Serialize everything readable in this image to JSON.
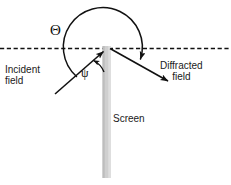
{
  "figure": {
    "background_color": "#ffffff",
    "line_color": "#111111",
    "screen_color": "#c9c9c9",
    "text_color": "#1a1a1a"
  },
  "labels": {
    "incident_line1": "Incident",
    "incident_line2": "field",
    "diffracted_line1": "Diffracted",
    "diffracted_line2": "field",
    "screen": "Screen"
  },
  "symbols": {
    "theta": "Θ",
    "psi": "ψ"
  },
  "elements": {
    "reference_line_name": "dashed-reference-axis",
    "screen_name": "screen-bar",
    "incident_arrow_name": "incident-field-arrow",
    "diffracted_arrow_name": "diffracted-field-arrow",
    "theta_arc_name": "theta-angle-arc",
    "psi_arc_name": "psi-angle-arc"
  }
}
